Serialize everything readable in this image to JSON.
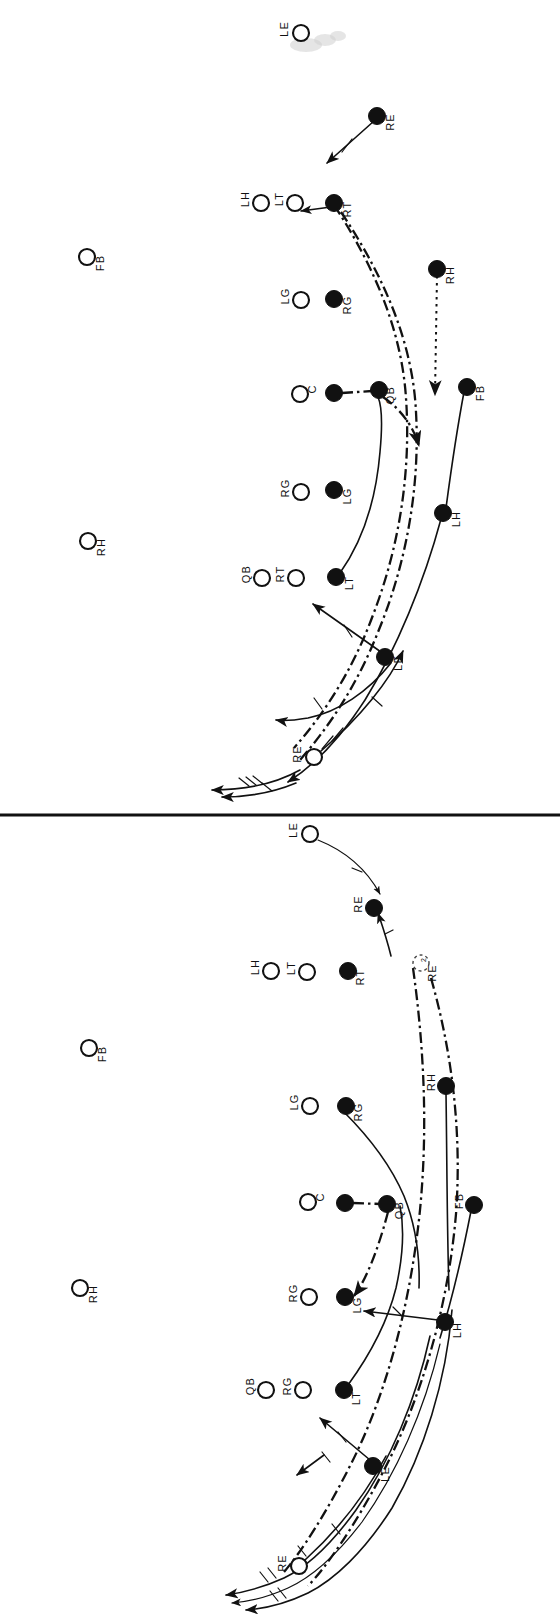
{
  "figure": {
    "kind": "football-play-diagram",
    "orientation": "rotated-90-labels-read-sideways",
    "panel_count": 2,
    "ink_color": "#111111",
    "background_color": "#ffffff"
  },
  "divider": {
    "name": "panel-divider",
    "y": 815
  },
  "panels": [
    {
      "id": "top-panel",
      "players": [
        {
          "id": "t-le-top",
          "label": "LE",
          "marker": "open",
          "x": 301,
          "y": 33,
          "label_dx": -16,
          "label_dy": -4
        },
        {
          "id": "t-fb-left",
          "label": "FB",
          "marker": "open",
          "x": 87,
          "y": 257,
          "label_dx": 14,
          "label_dy": 6
        },
        {
          "id": "t-rh-left",
          "label": "RH",
          "marker": "open",
          "x": 88,
          "y": 541,
          "label_dx": 14,
          "label_dy": 6
        },
        {
          "id": "t-re",
          "label": "RE",
          "marker": "filled",
          "x": 377,
          "y": 116,
          "label_dx": 14,
          "label_dy": 6
        },
        {
          "id": "t-lh",
          "label": "LH",
          "marker": "open",
          "x": 261,
          "y": 203,
          "label_dx": -15,
          "label_dy": -4
        },
        {
          "id": "t-lt",
          "label": "LT",
          "marker": "open",
          "x": 295,
          "y": 203,
          "label_dx": -15,
          "label_dy": -4
        },
        {
          "id": "t-rt",
          "label": "RT",
          "marker": "filled",
          "x": 334,
          "y": 203,
          "label_dx": 14,
          "label_dy": 6
        },
        {
          "id": "t-lg",
          "label": "LG",
          "marker": "open",
          "x": 301,
          "y": 300,
          "label_dx": -15,
          "label_dy": -4
        },
        {
          "id": "t-rg",
          "label": "RG",
          "marker": "filled",
          "x": 334,
          "y": 299,
          "label_dx": 14,
          "label_dy": 6
        },
        {
          "id": "t-c",
          "label": "C",
          "marker": "open",
          "x": 300,
          "y": 394,
          "label_dx": 13,
          "label_dy": -5
        },
        {
          "id": "t-qbsnap",
          "label": "",
          "marker": "filled",
          "x": 334,
          "y": 393,
          "label_dx": 0,
          "label_dy": 0
        },
        {
          "id": "t-qb",
          "label": "QB",
          "marker": "filled",
          "x": 379,
          "y": 390,
          "label_dx": 12,
          "label_dy": 5
        },
        {
          "id": "t-rh",
          "label": "RH",
          "marker": "filled",
          "x": 437,
          "y": 269,
          "label_dx": 14,
          "label_dy": 6
        },
        {
          "id": "t-fb",
          "label": "FB",
          "marker": "filled",
          "x": 467,
          "y": 387,
          "label_dx": 14,
          "label_dy": 6
        },
        {
          "id": "t-rg2",
          "label": "RG",
          "marker": "open",
          "x": 301,
          "y": 492,
          "label_dx": -15,
          "label_dy": -4
        },
        {
          "id": "t-lg2",
          "label": "LG",
          "marker": "filled",
          "x": 334,
          "y": 490,
          "label_dx": 14,
          "label_dy": 6
        },
        {
          "id": "t-lh2",
          "label": "LH",
          "marker": "filled",
          "x": 443,
          "y": 513,
          "label_dx": 14,
          "label_dy": 6
        },
        {
          "id": "t-qb2",
          "label": "QB",
          "marker": "open",
          "x": 262,
          "y": 578,
          "label_dx": -15,
          "label_dy": -4
        },
        {
          "id": "t-rt2",
          "label": "RT",
          "marker": "open",
          "x": 296,
          "y": 578,
          "label_dx": -15,
          "label_dy": -4
        },
        {
          "id": "t-lt2",
          "label": "LT",
          "marker": "filled",
          "x": 336,
          "y": 577,
          "label_dx": 14,
          "label_dy": 6
        },
        {
          "id": "t-le",
          "label": "LE",
          "marker": "filled",
          "x": 385,
          "y": 657,
          "label_dx": 14,
          "label_dy": 6
        },
        {
          "id": "t-re2",
          "label": "RE",
          "marker": "open",
          "x": 314,
          "y": 757,
          "label_dx": -16,
          "label_dy": -3
        }
      ]
    },
    {
      "id": "bottom-panel",
      "players": [
        {
          "id": "b-le-top",
          "label": "LE",
          "marker": "open",
          "x": 310,
          "y": 834,
          "label_dx": -16,
          "label_dy": -4
        },
        {
          "id": "b-fb-left",
          "label": "FB",
          "marker": "open",
          "x": 89,
          "y": 1048,
          "label_dx": 14,
          "label_dy": 6
        },
        {
          "id": "b-rh-left",
          "label": "RH",
          "marker": "open",
          "x": 80,
          "y": 1288,
          "label_dx": 14,
          "label_dy": 6
        },
        {
          "id": "b-re",
          "label": "RE",
          "marker": "filled",
          "x": 374,
          "y": 908,
          "label_dx": -15,
          "label_dy": -4
        },
        {
          "id": "b-re2",
          "label": "RE",
          "marker": "ghost",
          "x": 421,
          "y": 963,
          "label_dx": 12,
          "label_dy": 10,
          "superscript": "2"
        },
        {
          "id": "b-lh",
          "label": "LH",
          "marker": "open",
          "x": 271,
          "y": 971,
          "label_dx": -15,
          "label_dy": -4
        },
        {
          "id": "b-lt",
          "label": "LT",
          "marker": "open",
          "x": 307,
          "y": 972,
          "label_dx": -15,
          "label_dy": -4
        },
        {
          "id": "b-rt",
          "label": "RT",
          "marker": "filled",
          "x": 348,
          "y": 971,
          "label_dx": 13,
          "label_dy": 6
        },
        {
          "id": "b-rh",
          "label": "RH",
          "marker": "filled",
          "x": 446,
          "y": 1086,
          "label_dx": -14,
          "label_dy": -4
        },
        {
          "id": "b-lg",
          "label": "LG",
          "marker": "open",
          "x": 310,
          "y": 1106,
          "label_dx": -15,
          "label_dy": -4
        },
        {
          "id": "b-rg",
          "label": "RG",
          "marker": "filled",
          "x": 346,
          "y": 1106,
          "label_dx": 13,
          "label_dy": 6
        },
        {
          "id": "b-c",
          "label": "C",
          "marker": "open",
          "x": 308,
          "y": 1202,
          "label_dx": 13,
          "label_dy": -5
        },
        {
          "id": "b-qbsnap",
          "label": "",
          "marker": "filled",
          "x": 345,
          "y": 1203,
          "label_dx": 0,
          "label_dy": 0
        },
        {
          "id": "b-qb",
          "label": "QB",
          "marker": "filled",
          "x": 387,
          "y": 1204,
          "label_dx": 13,
          "label_dy": 6
        },
        {
          "id": "b-fb",
          "label": "FB",
          "marker": "filled",
          "x": 474,
          "y": 1205,
          "label_dx": -14,
          "label_dy": -4
        },
        {
          "id": "b-rg2",
          "label": "RG",
          "marker": "open",
          "x": 309,
          "y": 1297,
          "label_dx": -15,
          "label_dy": -4
        },
        {
          "id": "b-lg2",
          "label": "LG",
          "marker": "filled",
          "x": 345,
          "y": 1297,
          "label_dx": 13,
          "label_dy": 8
        },
        {
          "id": "b-lh2",
          "label": "LH",
          "marker": "filled",
          "x": 445,
          "y": 1322,
          "label_dx": 13,
          "label_dy": 8
        },
        {
          "id": "b-qb2",
          "label": "QB",
          "marker": "open",
          "x": 266,
          "y": 1390,
          "label_dx": -15,
          "label_dy": -4
        },
        {
          "id": "b-rg3",
          "label": "RG",
          "marker": "open",
          "x": 303,
          "y": 1390,
          "label_dx": -15,
          "label_dy": -4
        },
        {
          "id": "b-lt2",
          "label": "LT",
          "marker": "filled",
          "x": 344,
          "y": 1390,
          "label_dx": 13,
          "label_dy": 8
        },
        {
          "id": "b-le",
          "label": "LE",
          "marker": "filled",
          "x": 373,
          "y": 1466,
          "label_dx": 13,
          "label_dy": 8
        },
        {
          "id": "b-re3",
          "label": "RE",
          "marker": "open",
          "x": 299,
          "y": 1566,
          "label_dx": -16,
          "label_dy": -3
        }
      ]
    }
  ],
  "legend_notes": {
    "open_marker_meaning": "open circle",
    "filled_marker_meaning": "filled circle",
    "ghost_marker_meaning": "dashed circle"
  }
}
